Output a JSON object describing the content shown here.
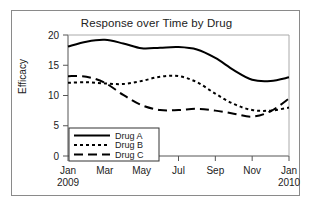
{
  "chart_data": {
    "type": "line",
    "title": "Response over Time by Drug",
    "xlabel": "",
    "ylabel": "Efficacy",
    "ylim": [
      0,
      20
    ],
    "yticks": [
      0,
      5,
      10,
      15,
      20
    ],
    "ytick_labels": [
      "0",
      "5",
      "10",
      "15",
      "20"
    ],
    "xtick_labels": [
      "Jan",
      "Mar",
      "May",
      "Jul",
      "Sep",
      "Nov",
      "Jan"
    ],
    "xtick_sublabels": [
      "2009",
      "",
      "",
      "",
      "",
      "",
      "2010"
    ],
    "x": [
      "Jan 2009",
      "Feb",
      "Mar",
      "Apr",
      "May",
      "Jun",
      "Jul",
      "Aug",
      "Sep",
      "Oct",
      "Nov",
      "Dec",
      "Jan 2010"
    ],
    "grid": false,
    "legend_position": "lower left",
    "series": [
      {
        "name": "Drug A",
        "style": "solid",
        "color": "#000000",
        "values": [
          18.1,
          18.9,
          19.2,
          18.6,
          17.8,
          17.9,
          18.0,
          17.6,
          16.2,
          14.2,
          12.6,
          12.4,
          13.0
        ]
      },
      {
        "name": "Drug B",
        "style": "dotted",
        "color": "#000000",
        "values": [
          12.1,
          12.2,
          12.0,
          11.9,
          12.4,
          13.1,
          13.2,
          12.2,
          10.3,
          8.6,
          7.6,
          7.5,
          8.0
        ]
      },
      {
        "name": "Drug C",
        "style": "dashed",
        "color": "#000000",
        "values": [
          13.2,
          13.1,
          12.1,
          10.1,
          8.4,
          7.6,
          7.6,
          7.8,
          7.5,
          7.0,
          6.5,
          7.4,
          9.5
        ]
      }
    ]
  },
  "legend": {
    "items": [
      {
        "label": "Drug A"
      },
      {
        "label": "Drug B"
      },
      {
        "label": "Drug C"
      }
    ]
  }
}
